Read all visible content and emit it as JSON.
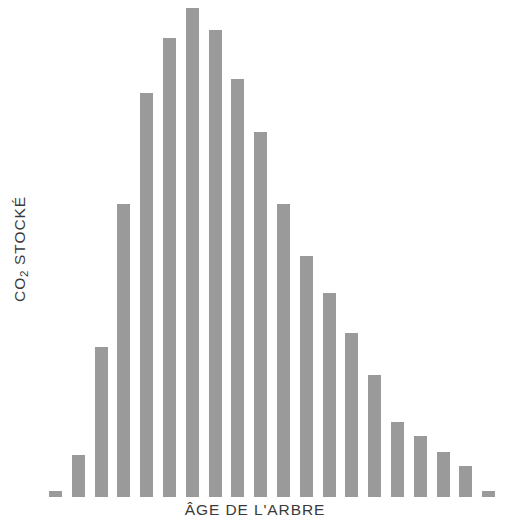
{
  "chart_data": {
    "type": "bar",
    "title": "",
    "subtitle": "",
    "xlabel": "ÂGE DE L'ARBRE",
    "ylabel": "CO2 STOCKÉ",
    "ylabel_prefix": "CO",
    "ylabel_subscript": "2",
    "ylabel_suffix": " STOCKÉ",
    "grid": false,
    "legend": null,
    "axis_ticks": false,
    "axis_lines": false,
    "bar_color": "#9a9a9a",
    "text_color": "#3a3a3a",
    "background_color": "#ffffff",
    "categories": [
      "1",
      "2",
      "3",
      "4",
      "5",
      "6",
      "7",
      "8",
      "9",
      "10",
      "11",
      "12",
      "13",
      "14",
      "15",
      "16",
      "17",
      "18",
      "19",
      "20"
    ],
    "values": [
      6,
      42,
      150,
      293,
      404,
      459,
      489,
      467,
      418,
      365,
      293,
      241,
      204,
      164,
      122,
      75,
      61,
      45,
      31,
      6
    ],
    "ylim": [
      0,
      497
    ],
    "xlim": [
      0,
      20
    ],
    "n_bars": 20,
    "bar_width_px": 13,
    "bar_gap_px": 10,
    "baseline_y_px": 497
  },
  "axis_labels": {
    "y": "CO2 STOCKÉ",
    "x": "ÂGE DE L'ARBRE"
  }
}
